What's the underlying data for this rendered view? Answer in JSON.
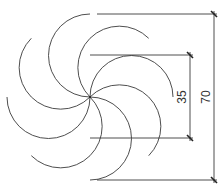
{
  "drawing": {
    "type": "rosette",
    "petal_count": 8,
    "center": [
      90,
      97
    ],
    "outer_radius_px": 83,
    "petal_radius_px": 41.5,
    "line_color": "#3a3a3a"
  },
  "dimensions": {
    "outer": {
      "label": "70",
      "x": 214,
      "y1": 14,
      "y2": 180
    },
    "inner": {
      "label": "35",
      "x": 190,
      "y1": 55,
      "y2": 138
    }
  }
}
